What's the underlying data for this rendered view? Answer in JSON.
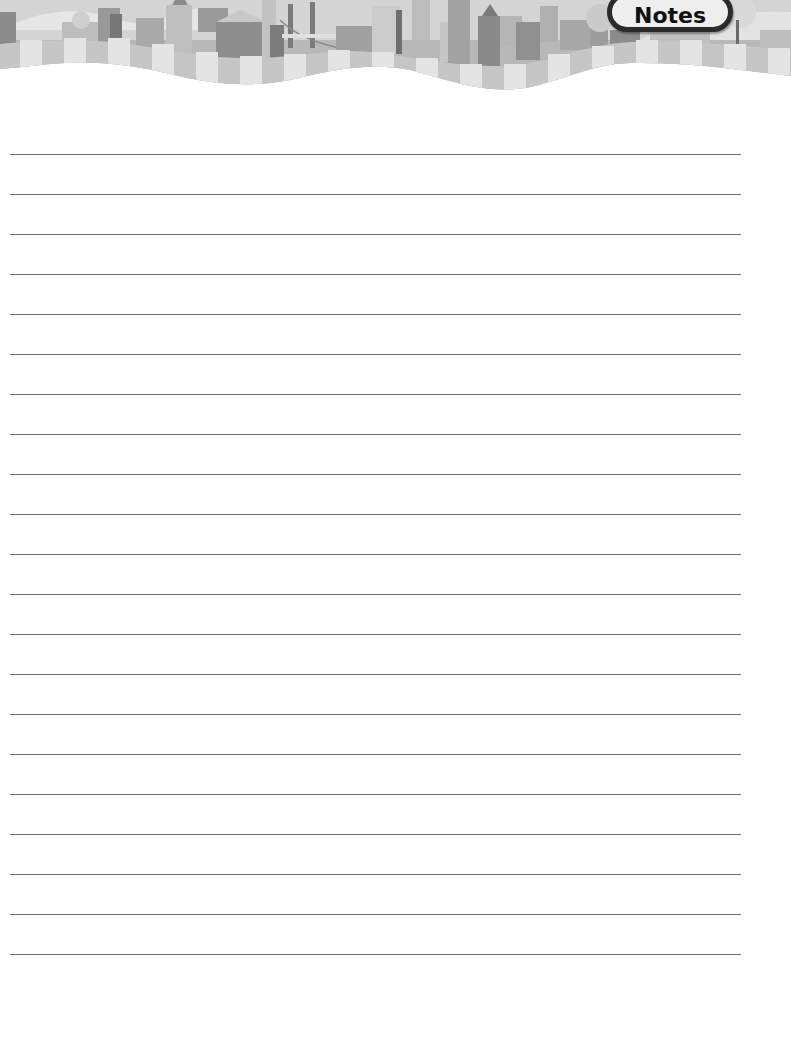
{
  "header": {
    "tab_label": "Notes",
    "illustration": "city-skyline-banner",
    "colors": {
      "sky": "#d6d6d6",
      "buildings_dark": "#7a7a7a",
      "buildings_mid": "#a6a6a6",
      "buildings_light": "#c9c9c9",
      "band_dark": "#c4c4c4",
      "band_light": "#e2e2e2"
    }
  },
  "page": {
    "background": "#ffffff",
    "line_color": "#6e6e6e",
    "line_count": 21,
    "first_line_y": 154,
    "line_spacing": 40,
    "line_left_x": 10,
    "line_right_x": 741,
    "lines": [
      "",
      "",
      "",
      "",
      "",
      "",
      "",
      "",
      "",
      "",
      "",
      "",
      "",
      "",
      "",
      "",
      "",
      "",
      "",
      "",
      ""
    ]
  }
}
